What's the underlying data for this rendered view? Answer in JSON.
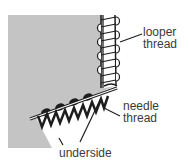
{
  "diagram": {
    "colors": {
      "fabric": "#c4c4c4",
      "thread_dark": "#1e1e1e",
      "thread_light": "#ffffff",
      "text": "#3a3a3a"
    },
    "labels": [
      {
        "id": "looper",
        "line1": "looper",
        "line2": "thread"
      },
      {
        "id": "needle",
        "line1": "needle",
        "line2": "thread"
      },
      {
        "id": "underside",
        "line1": "underside"
      }
    ]
  }
}
